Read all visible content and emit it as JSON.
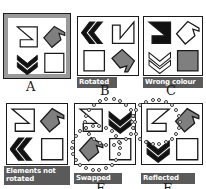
{
  "figure": {
    "colors": {
      "outline": "#1a1a1a",
      "white_fill": "#ffffff",
      "grey_fill": "#7f7f7f",
      "black_fill": "#111111",
      "caption_bg": "#5a5a5a",
      "caption_text": "#ffffff",
      "highlight_border": "#9a9a9a"
    }
  },
  "panels": [
    {
      "id": "panel-a",
      "letter": "A",
      "caption": "",
      "highlighted": true,
      "marked": false,
      "cells": [
        {
          "pos": "top-left",
          "shape": "zigzag-z",
          "fill": "white",
          "rotation": 0,
          "flipped": false
        },
        {
          "pos": "top-right",
          "shape": "arrow-tag",
          "fill": "grey",
          "rotation": 0,
          "flipped": false
        },
        {
          "pos": "bottom-left",
          "shape": "chevron-double",
          "fill": "black",
          "rotation": 0,
          "flipped": false
        },
        {
          "pos": "bottom-right",
          "shape": "square",
          "fill": "white",
          "rotation": 0,
          "flipped": false
        }
      ]
    },
    {
      "id": "panel-b",
      "letter": "B",
      "caption": "Rotated",
      "highlighted": false,
      "marked": false,
      "cells": [
        {
          "pos": "top-left",
          "shape": "chevron-double",
          "fill": "black",
          "rotation": 90,
          "flipped": false
        },
        {
          "pos": "top-right",
          "shape": "zigzag-z",
          "fill": "white",
          "rotation": 90,
          "flipped": false
        },
        {
          "pos": "bottom-left",
          "shape": "square",
          "fill": "white",
          "rotation": 90,
          "flipped": false
        },
        {
          "pos": "bottom-right",
          "shape": "arrow-tag",
          "fill": "grey",
          "rotation": 90,
          "flipped": false
        }
      ]
    },
    {
      "id": "panel-c",
      "letter": "C",
      "caption": "Wrong colour",
      "highlighted": false,
      "marked": false,
      "cells": [
        {
          "pos": "top-left",
          "shape": "zigzag-z",
          "fill": "black",
          "rotation": 0,
          "flipped": false
        },
        {
          "pos": "top-right",
          "shape": "arrow-tag",
          "fill": "white",
          "rotation": 0,
          "flipped": false
        },
        {
          "pos": "bottom-left",
          "shape": "chevron-double",
          "fill": "white",
          "rotation": 0,
          "flipped": false
        },
        {
          "pos": "bottom-right",
          "shape": "square",
          "fill": "grey",
          "rotation": 0,
          "flipped": false
        }
      ]
    },
    {
      "id": "panel-d",
      "letter": "",
      "caption": "Elements not\nrotated",
      "highlighted": false,
      "marked": false,
      "cells": [
        {
          "pos": "top-left",
          "shape": "zigzag-z",
          "fill": "white",
          "rotation": 0,
          "flipped": false
        },
        {
          "pos": "top-right",
          "shape": "arrow-tag",
          "fill": "grey",
          "rotation": 0,
          "flipped": false
        },
        {
          "pos": "bottom-left",
          "shape": "chevron-double",
          "fill": "black",
          "rotation": 90,
          "flipped": false
        },
        {
          "pos": "bottom-right",
          "shape": "square",
          "fill": "white",
          "rotation": 0,
          "flipped": false
        }
      ]
    },
    {
      "id": "panel-e",
      "letter": "E",
      "caption": "Swapped",
      "highlighted": false,
      "marked": true,
      "cells": [
        {
          "pos": "top-left",
          "shape": "zigzag-z",
          "fill": "white",
          "rotation": 0,
          "flipped": false
        },
        {
          "pos": "top-right",
          "shape": "chevron-double",
          "fill": "black",
          "rotation": 0,
          "flipped": false
        },
        {
          "pos": "bottom-left",
          "shape": "arrow-tag",
          "fill": "grey",
          "rotation": 0,
          "flipped": false
        },
        {
          "pos": "bottom-right",
          "shape": "square",
          "fill": "white",
          "rotation": 0,
          "flipped": false
        }
      ]
    },
    {
      "id": "panel-f",
      "letter": "F",
      "caption": "Reflected",
      "highlighted": false,
      "marked": true,
      "cells": [
        {
          "pos": "top-left",
          "shape": "zigzag-z",
          "fill": "white",
          "rotation": 0,
          "flipped": true
        },
        {
          "pos": "top-right",
          "shape": "arrow-tag",
          "fill": "grey",
          "rotation": 0,
          "flipped": false
        },
        {
          "pos": "bottom-left",
          "shape": "chevron-double",
          "fill": "black",
          "rotation": 0,
          "flipped": false
        },
        {
          "pos": "bottom-right",
          "shape": "square",
          "fill": "white",
          "rotation": 0,
          "flipped": false
        }
      ]
    }
  ],
  "labels": {
    "a": "A",
    "b": "B",
    "c": "C",
    "e": "E",
    "f": "F",
    "rotated": "Rotated",
    "wrong_colour": "Wrong colour",
    "elements_not_rotated": "Elements not\nrotated",
    "swapped": "Swapped",
    "reflected": "Reflected"
  }
}
